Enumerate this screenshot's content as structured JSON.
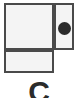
{
  "canvas": {
    "width": 77,
    "height": 98,
    "background_color": "#ffffff"
  },
  "diagram": {
    "title": "",
    "border_color": "#4a4a4a",
    "cell_fill_color": "#f4f4f4",
    "marker_color": "#2b2b2b",
    "cells": [
      {
        "id": "main",
        "label": "",
        "role": "large-upper-left-cell"
      },
      {
        "id": "side",
        "label": "",
        "role": "narrow-right-cell"
      },
      {
        "id": "bottom",
        "label": "",
        "role": "lower-left-cell"
      }
    ],
    "marker": {
      "shape": "filled-circle",
      "label": "",
      "color": "#2b2b2b",
      "diameter": 13,
      "center_x": 65,
      "center_y": 27
    }
  },
  "glyph": {
    "character": "C",
    "color": "#2b2b2b",
    "clipped": true,
    "note": ""
  }
}
